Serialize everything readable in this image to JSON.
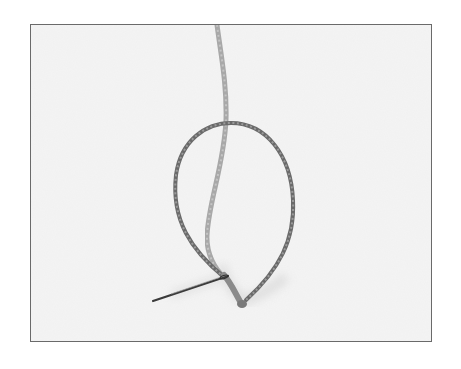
{
  "image": {
    "description": "Photograph of a threaded sewing needle with a loop of twisted thread on a pale background",
    "alt": "Needle threaded with a looped strand of twisted thread",
    "frame": {
      "border_color": "#6a6a6a",
      "background_color": "#f4f4f4"
    },
    "colors": {
      "page_background": "#ffffff",
      "thread_dark": "#5e5e5e",
      "thread_light": "#a8a8a8",
      "needle": "#3a3a3a",
      "shadow": "#d8d8d8"
    },
    "objects": [
      {
        "name": "thread-strand-vertical",
        "label": "Thread strand"
      },
      {
        "name": "thread-loop",
        "label": "Thread loop"
      },
      {
        "name": "needle",
        "label": "Needle"
      },
      {
        "name": "thread-knot",
        "label": "Thread twist at needle eye"
      }
    ]
  }
}
